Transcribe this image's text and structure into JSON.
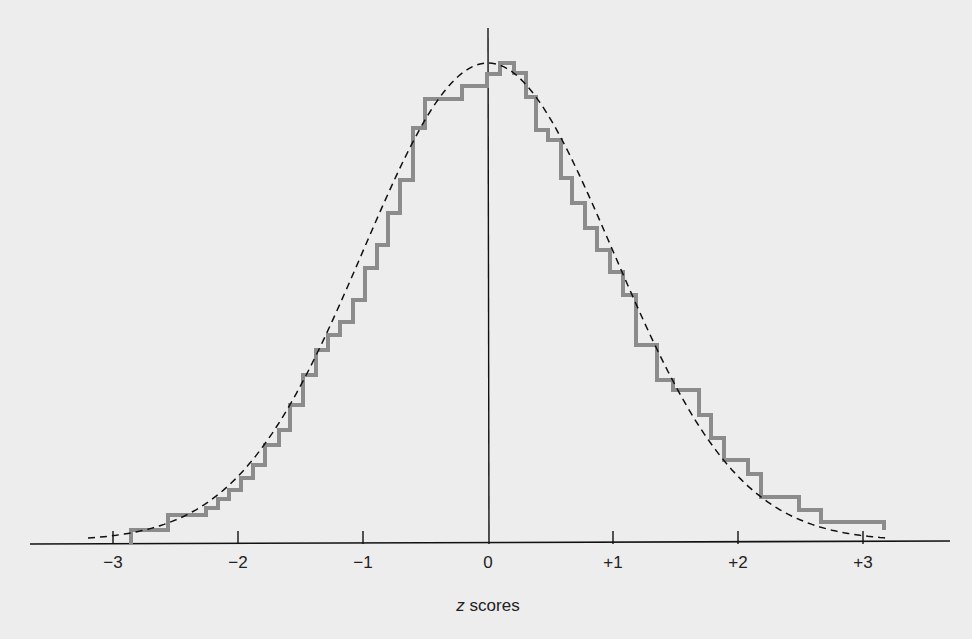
{
  "chart_data": {
    "type": "line",
    "title": "",
    "xlabel": "z scores",
    "xlabel_parts": {
      "variable": "z",
      "rest": " scores"
    },
    "ylabel": "",
    "xlim": [
      -3.2,
      3.2
    ],
    "grid": false,
    "legend": null,
    "x_ticks": [
      {
        "value": -3,
        "label": "−3"
      },
      {
        "value": -2,
        "label": "−2"
      },
      {
        "value": -1,
        "label": "−1"
      },
      {
        "value": 0,
        "label": "0"
      },
      {
        "value": 1,
        "label": "+1"
      },
      {
        "value": 2,
        "label": "+2"
      },
      {
        "value": 3,
        "label": "+3"
      }
    ],
    "series": [
      {
        "name": "empirical distribution (step histogram)",
        "style": "solid-gray-step",
        "color": "#8c8c8c",
        "points_px": [
          [
            131,
            544
          ],
          [
            131,
            530
          ],
          [
            168,
            530
          ],
          [
            168,
            515
          ],
          [
            206,
            515
          ],
          [
            206,
            508
          ],
          [
            218,
            508
          ],
          [
            218,
            499
          ],
          [
            229,
            499
          ],
          [
            229,
            490
          ],
          [
            241,
            490
          ],
          [
            241,
            478
          ],
          [
            253,
            478
          ],
          [
            253,
            465
          ],
          [
            265,
            465
          ],
          [
            265,
            445
          ],
          [
            279,
            445
          ],
          [
            279,
            430
          ],
          [
            290,
            430
          ],
          [
            290,
            405
          ],
          [
            303,
            405
          ],
          [
            303,
            375
          ],
          [
            316,
            375
          ],
          [
            316,
            350
          ],
          [
            328,
            350
          ],
          [
            328,
            335
          ],
          [
            340,
            335
          ],
          [
            340,
            322
          ],
          [
            353,
            322
          ],
          [
            353,
            300
          ],
          [
            365,
            300
          ],
          [
            365,
            268
          ],
          [
            377,
            268
          ],
          [
            377,
            245
          ],
          [
            388,
            245
          ],
          [
            388,
            213
          ],
          [
            400,
            213
          ],
          [
            400,
            180
          ],
          [
            413,
            180
          ],
          [
            413,
            128
          ],
          [
            425,
            128
          ],
          [
            425,
            99
          ],
          [
            462,
            99
          ],
          [
            462,
            86
          ],
          [
            487,
            86
          ],
          [
            487,
            74
          ],
          [
            500,
            74
          ],
          [
            500,
            63
          ],
          [
            514,
            63
          ],
          [
            514,
            73
          ],
          [
            526,
            73
          ],
          [
            526,
            97
          ],
          [
            536,
            97
          ],
          [
            536,
            130
          ],
          [
            548,
            130
          ],
          [
            548,
            140
          ],
          [
            561,
            140
          ],
          [
            561,
            178
          ],
          [
            572,
            178
          ],
          [
            572,
            203
          ],
          [
            585,
            203
          ],
          [
            585,
            228
          ],
          [
            597,
            228
          ],
          [
            597,
            250
          ],
          [
            610,
            250
          ],
          [
            610,
            272
          ],
          [
            623,
            272
          ],
          [
            623,
            295
          ],
          [
            636,
            295
          ],
          [
            636,
            345
          ],
          [
            657,
            345
          ],
          [
            657,
            380
          ],
          [
            673,
            380
          ],
          [
            673,
            390
          ],
          [
            699,
            390
          ],
          [
            699,
            415
          ],
          [
            711,
            415
          ],
          [
            711,
            438
          ],
          [
            724,
            438
          ],
          [
            724,
            460
          ],
          [
            748,
            460
          ],
          [
            748,
            474
          ],
          [
            761,
            474
          ],
          [
            761,
            497
          ],
          [
            799,
            497
          ],
          [
            799,
            510
          ],
          [
            821,
            510
          ],
          [
            821,
            522
          ],
          [
            884,
            522
          ],
          [
            884,
            530
          ]
        ]
      },
      {
        "name": "normal curve",
        "style": "dashed-black",
        "color": "#111111",
        "mean": 0,
        "sd": 1,
        "x_range": [
          -3.2,
          3.2
        ]
      }
    ],
    "approx_relative_frequency_by_z": {
      "x": [
        -2.8,
        -2.5,
        -2.2,
        -2.0,
        -1.8,
        -1.6,
        -1.4,
        -1.2,
        -1.0,
        -0.8,
        -0.6,
        -0.4,
        -0.2,
        0.0,
        0.1,
        0.3,
        0.5,
        0.7,
        0.9,
        1.1,
        1.3,
        1.5,
        1.7,
        1.9,
        2.1,
        2.3,
        2.6,
        3.0
      ],
      "y": [
        0.03,
        0.06,
        0.08,
        0.12,
        0.17,
        0.24,
        0.35,
        0.43,
        0.52,
        0.58,
        0.68,
        0.82,
        0.95,
        0.98,
        1.0,
        0.92,
        0.83,
        0.75,
        0.65,
        0.55,
        0.37,
        0.33,
        0.25,
        0.17,
        0.1,
        0.07,
        0.04,
        0.04
      ]
    }
  },
  "layout": {
    "axis_y_px": 544,
    "axis_x_start_px": 30,
    "axis_x_end_px": 950,
    "zero_x_px": 488,
    "px_per_sd": 125,
    "vertical_line_top_px": 28,
    "vertical_line_bottom_px": 544,
    "curve_peak_y_px": 66,
    "background": "#ededed",
    "axis_color": "#111111",
    "step_color": "#8c8c8c"
  }
}
